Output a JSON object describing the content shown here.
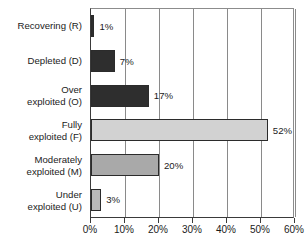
{
  "chart_data": {
    "type": "bar",
    "orientation": "horizontal",
    "title": "",
    "subtitle": "",
    "xlabel": "",
    "ylabel": "",
    "xlim": [
      0,
      60
    ],
    "xtick_values": [
      0,
      10,
      20,
      30,
      40,
      50,
      60
    ],
    "xtick_labels": [
      "0%",
      "10%",
      "20%",
      "30%",
      "40%",
      "50%",
      "60%"
    ],
    "grid": "vertical",
    "legend": "none",
    "categories": [
      "Recovering (R)",
      "Depleted (D)",
      "Over\nexploited (O)",
      "Fully\nexploited (F)",
      "Moderately\nexploited (M)",
      "Under\nexploited (U)"
    ],
    "values": [
      1,
      7,
      17,
      52,
      20,
      3
    ],
    "value_labels": [
      "1%",
      "7%",
      "17%",
      "52%",
      "20%",
      "3%"
    ],
    "bar_colors": [
      "#2e2e2e",
      "#2e2e2e",
      "#2e2e2e",
      "#d2d2d2",
      "#a9a9a9",
      "#b9b9b9"
    ],
    "bar_border_color": "#2b2b2b",
    "axis_color": "#3a3a3a",
    "grid_color": "#8a8a8a",
    "background_color": "#ffffff"
  }
}
